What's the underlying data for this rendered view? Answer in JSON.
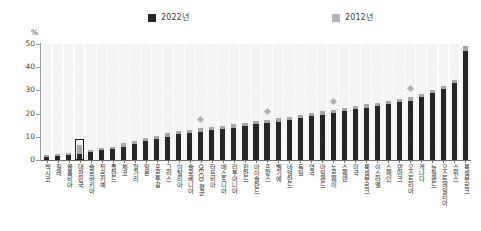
{
  "chart_data": {
    "type": "bar",
    "title": "",
    "subtitle": "",
    "xlabel": "",
    "ylabel": "%",
    "ylim": [
      0,
      50
    ],
    "yticks": [
      0,
      10,
      20,
      30,
      40,
      50
    ],
    "grid": true,
    "legend_position": "top-center",
    "stacked_note": "Each column shows the 2022 value (dark) with the 2012 value indicated by the lighter grey segment/marker",
    "series": [
      {
        "name": "2022년",
        "color": "#262626",
        "values": [
          2.0,
          2.4,
          3.0,
          6.3,
          4.4,
          5.3,
          5.6,
          7.4,
          8.3,
          9.6,
          10.4,
          11.5,
          12.4,
          13.0,
          13.6,
          14.2,
          14.8,
          15.4,
          16.0,
          16.8,
          17.4,
          18.0,
          18.6,
          19.4,
          20.3,
          21.0,
          21.6,
          22.4,
          23.2,
          24.0,
          24.6,
          25.4,
          26.3,
          27.0,
          28.4,
          30.2,
          32.0,
          34.5,
          49.0
        ]
      },
      {
        "name": "2012년",
        "color": "#a6a6a6",
        "values": [
          1.4,
          1.8,
          2.2,
          2.6,
          3.4,
          4.2,
          4.6,
          5.8,
          7.0,
          8.0,
          9.0,
          10.0,
          11.0,
          11.6,
          12.2,
          13.0,
          13.4,
          14.0,
          14.6,
          15.4,
          16.0,
          16.6,
          17.2,
          18.0,
          19.0,
          19.6,
          20.2,
          21.0,
          21.8,
          22.6,
          23.2,
          24.0,
          25.0,
          25.6,
          27.0,
          28.8,
          30.4,
          33.0,
          47.0
        ]
      }
    ],
    "categories": [
      "멕시코",
      "칠레",
      "콜롬비아",
      "대한민국",
      "슬로바키아",
      "튀르키예",
      "폴란드",
      "체코",
      "헝가리",
      "일본",
      "포르투갈",
      "그리스",
      "이탈리아",
      "슬로베니아",
      "OECD 평균",
      "라트비아",
      "에스토니아",
      "리투아니아",
      "핀란드",
      "아이슬란드",
      "프랑스",
      "벨기에",
      "네덜란드",
      "독일",
      "영국",
      "아일랜드",
      "노르웨이",
      "스웨덴",
      "미국",
      "룩셈부르크",
      "이스라엘",
      "스페인",
      "덴마크",
      "오스트리아",
      "캐나다",
      "뉴질랜드",
      "오스트레일리아",
      "스위스",
      "룩셈부르크"
    ],
    "highlight": {
      "category": "대한민국",
      "index": 3,
      "style": "black rectangle outline around the column"
    },
    "markers": {
      "description": "light grey diamond markers above selected columns indicating 2012 reference value",
      "indices": [
        14,
        20,
        26,
        33
      ]
    }
  },
  "legend": {
    "items": [
      {
        "label": "2022년",
        "color": "#262626"
      },
      {
        "label": "2012년",
        "color": "#b3b3b3"
      }
    ]
  },
  "axis": {
    "unit": "%",
    "y_labels": [
      "50",
      "40",
      "30",
      "20",
      "10",
      "0"
    ]
  }
}
